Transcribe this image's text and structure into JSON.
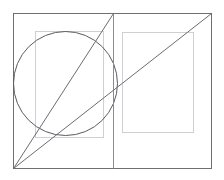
{
  "canvas": {
    "width": 224,
    "height": 180,
    "background": "#ffffff",
    "title": "Geometric construction diagram"
  },
  "palette": {
    "frame_stroke": "#6e6e73",
    "divider_stroke": "#8a8a8f",
    "inner_rect_stroke": "#d0d0d4",
    "circle_stroke": "#5a5a60",
    "diagonal_stroke": "#6b6b72",
    "page_fill": "#fdfdfd"
  },
  "shapes": {
    "outer_frame": {
      "name": "outer-frame",
      "x": 13,
      "y": 13,
      "width": 198,
      "height": 155,
      "stroke_width": 1
    },
    "divider": {
      "name": "center-divider",
      "x1": 113,
      "y1": 13,
      "x2": 113,
      "y2": 168,
      "stroke_width": 1
    },
    "left_inner_rect": {
      "name": "left-text-block",
      "x": 35,
      "y": 31,
      "width": 68,
      "height": 106,
      "stroke_width": 1
    },
    "right_inner_rect": {
      "name": "right-text-block",
      "x": 122,
      "y": 32,
      "width": 71,
      "height": 100,
      "stroke_width": 1
    },
    "circle": {
      "name": "construction-circle",
      "cx": 65,
      "cy": 83,
      "r": 52,
      "stroke_width": 1
    },
    "diagonal_long": {
      "name": "diagonal-full-spread",
      "x1": 13,
      "y1": 168,
      "x2": 211,
      "y2": 13,
      "stroke_width": 1
    },
    "diagonal_short": {
      "name": "diagonal-left-page",
      "x1": 13,
      "y1": 168,
      "x2": 113,
      "y2": 13,
      "stroke_width": 1
    }
  },
  "chart_data": {
    "type": "diagram",
    "elements": [
      {
        "label": "Outer frame",
        "kind": "rectangle",
        "x": 13,
        "y": 13,
        "w": 198,
        "h": 155
      },
      {
        "label": "Gutter / spine divider",
        "kind": "line",
        "x1": 113,
        "y1": 13,
        "x2": 113,
        "y2": 168
      },
      {
        "label": "Left type area",
        "kind": "rectangle",
        "x": 35,
        "y": 31,
        "w": 68,
        "h": 106
      },
      {
        "label": "Right type area",
        "kind": "rectangle",
        "x": 122,
        "y": 32,
        "w": 71,
        "h": 100
      },
      {
        "label": "Inscribed circle",
        "kind": "circle",
        "cx": 65,
        "cy": 83,
        "r": 52
      },
      {
        "label": "Spread diagonal",
        "kind": "line",
        "x1": 13,
        "y1": 168,
        "x2": 211,
        "y2": 13
      },
      {
        "label": "Page diagonal",
        "kind": "line",
        "x1": 13,
        "y1": 168,
        "x2": 113,
        "y2": 13
      }
    ]
  }
}
